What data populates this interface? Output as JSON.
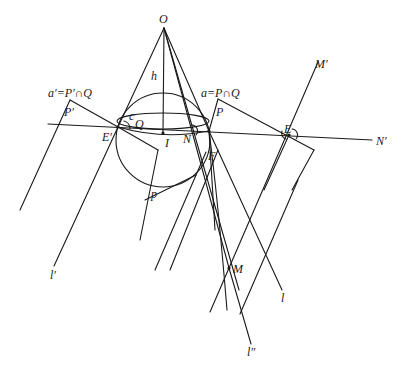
{
  "diagram": {
    "labels": {
      "O": "O",
      "h": "h",
      "a_prime_eq": "a′=P′∩Q",
      "P_prime": "P′",
      "c": "c",
      "Q": "Q",
      "E_prime": "E′",
      "I": "I",
      "N": "N",
      "a_eq": "a=P∩Q",
      "P": "P",
      "E": "E",
      "M_prime": "M′",
      "N_prime": "N′",
      "F": "F",
      "p": "p",
      "l_prime": "l′",
      "M": "M",
      "l": "l",
      "l_double_prime": "l″"
    },
    "colors": {
      "stroke": "#1a1a1a",
      "background": "#ffffff"
    }
  }
}
